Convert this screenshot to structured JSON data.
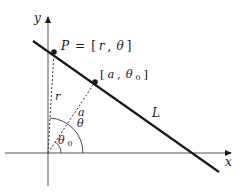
{
  "diagram": {
    "type": "polar-coordinates-line",
    "axes": {
      "x_label": "x",
      "y_label": "y"
    },
    "line": {
      "label": "L"
    },
    "points": {
      "P": {
        "name": "P",
        "equals": "=",
        "coords_open": "[",
        "r": "r",
        "comma": ",",
        "theta": "θ",
        "coords_close": "]"
      },
      "foot": {
        "open": "[",
        "a": "a",
        "comma": ",",
        "theta": "θ",
        "sub": "0",
        "close": "]"
      }
    },
    "segments": {
      "r_label": "r",
      "a_label": "a"
    },
    "angles": {
      "theta_label": "θ",
      "theta0_label": "θ",
      "theta0_sub": "0"
    },
    "colors": {
      "stroke": "#1a1a1a",
      "background": "#ffffff"
    }
  }
}
